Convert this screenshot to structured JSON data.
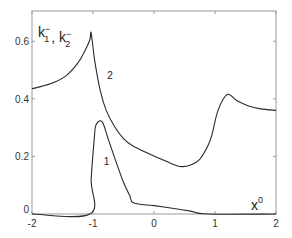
{
  "chart_data": {
    "type": "line",
    "title": "",
    "xlabel": "x",
    "xlabel_superscript": "0",
    "ylabel_parts": [
      {
        "base": "k",
        "sub": "1",
        "sup": "−"
      },
      {
        "sep": ", "
      },
      {
        "base": "k",
        "sub": "2",
        "sup": "−"
      }
    ],
    "ylabel": "k1⁻, k2⁻",
    "xlim": [
      -2,
      2
    ],
    "ylim": [
      0,
      0.705
    ],
    "xticks": [
      -2,
      -1,
      0,
      1,
      2
    ],
    "xtick_labels": [
      "-2",
      "-1",
      "0",
      "1",
      "2"
    ],
    "yticks": [
      0,
      0.2,
      0.4,
      0.6
    ],
    "ytick_labels": [
      "0",
      "0.2",
      "0.4",
      "0.6"
    ],
    "grid": false,
    "legend": "none (curves labeled inline)",
    "series": [
      {
        "name": "1",
        "label_pos": {
          "x": -0.78,
          "y": 0.17
        },
        "x": [
          -2.0,
          -1.05,
          -1.03,
          -0.98,
          -0.95,
          -0.85,
          -0.75,
          -0.62,
          -0.5,
          -0.4,
          -0.33,
          0.0,
          0.3,
          0.6,
          0.89,
          2.0
        ],
        "y": [
          0.0,
          0.0,
          0.12,
          0.26,
          0.31,
          0.32,
          0.26,
          0.18,
          0.11,
          0.065,
          0.038,
          0.029,
          0.02,
          0.01,
          0.0,
          0.0
        ]
      },
      {
        "name": "2",
        "label_pos": {
          "x": -0.72,
          "y": 0.47
        },
        "x": [
          -2.0,
          -1.7,
          -1.45,
          -1.25,
          -1.12,
          -1.05,
          -1.03,
          -0.97,
          -0.88,
          -0.78,
          -0.65,
          -0.5,
          -0.35,
          -0.1,
          0.2,
          0.43,
          0.6,
          0.75,
          0.88,
          0.95,
          1.05,
          1.2,
          1.35,
          1.55,
          1.75,
          2.0
        ],
        "y": [
          0.435,
          0.452,
          0.479,
          0.524,
          0.572,
          0.606,
          0.628,
          0.53,
          0.428,
          0.358,
          0.305,
          0.262,
          0.237,
          0.211,
          0.183,
          0.165,
          0.17,
          0.19,
          0.235,
          0.275,
          0.36,
          0.415,
          0.395,
          0.375,
          0.365,
          0.36
        ]
      }
    ]
  },
  "colors": {
    "axes": "#9a9a9a",
    "curve": "#2a2a2a",
    "text": "#333333",
    "background": "#ffffff"
  }
}
